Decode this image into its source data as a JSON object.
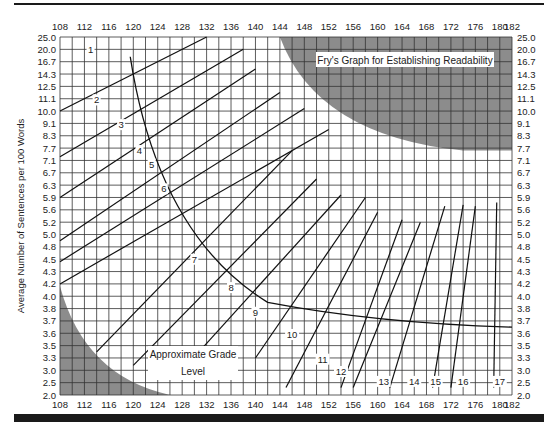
{
  "chart_data": {
    "type": "line",
    "title": "Fry's Graph for Establishing Readability",
    "xlabel": "Average Number of Syllables per 100 Words",
    "ylabel": "Average Number of Sentences per 100 Words",
    "annotation": [
      "Approximate Grade",
      "Level"
    ],
    "x_ticks": [
      108,
      112,
      116,
      120,
      124,
      128,
      132,
      136,
      140,
      144,
      148,
      152,
      156,
      160,
      164,
      168,
      172,
      176,
      180,
      182
    ],
    "y_ticks": [
      "25.0",
      "20.0",
      "16.7",
      "14.3",
      "12.5",
      "11.1",
      "10.0",
      "9.1",
      "8.3",
      "7.7",
      "7.1",
      "6.7",
      "6.3",
      "5.9",
      "5.6",
      "5.2",
      "5.0",
      "4.8",
      "4.5",
      "4.3",
      "4.2",
      "4.0",
      "3.8",
      "3.7",
      "3.6",
      "3.5",
      "3.3",
      "3.0",
      "2.5",
      "2.0"
    ],
    "xlim": [
      108,
      182
    ],
    "grid": true,
    "grid_x_step": 2,
    "grade_lines": [
      {
        "grade": "1",
        "x1": 108,
        "y1": 6.0,
        "x2": 132,
        "y2": 0
      },
      {
        "grade": "2",
        "x1": 108,
        "y1": 9.7,
        "x2": 138,
        "y2": 1.0
      },
      {
        "grade": "3",
        "x1": 108,
        "y1": 13.0,
        "x2": 140,
        "y2": 2.6
      },
      {
        "grade": "4",
        "x1": 108,
        "y1": 16.5,
        "x2": 144,
        "y2": 4.5
      },
      {
        "grade": "5",
        "x1": 108,
        "y1": 18.2,
        "x2": 148,
        "y2": 5.8
      },
      {
        "grade": "6",
        "x1": 108,
        "y1": 20.0,
        "x2": 152,
        "y2": 7.5
      },
      {
        "grade": "7",
        "x1": 114,
        "y1": 25.5,
        "x2": 146,
        "y2": 9.2
      },
      {
        "grade": "8",
        "x1": 120,
        "y1": 26.6,
        "x2": 150,
        "y2": 11.5
      },
      {
        "grade": "9",
        "x1": 128,
        "y1": 27.0,
        "x2": 154,
        "y2": 12.8
      },
      {
        "grade": "10",
        "x1": 140,
        "y1": 26.0,
        "x2": 158,
        "y2": 13.0
      },
      {
        "grade": "11",
        "x1": 145,
        "y1": 28.4,
        "x2": 160,
        "y2": 14.2
      },
      {
        "grade": "12",
        "x1": 154,
        "y1": 28.4,
        "x2": 164,
        "y2": 14.8
      },
      {
        "grade": "13",
        "x1": 156,
        "y1": 28.4,
        "x2": 167,
        "y2": 15.0
      },
      {
        "grade": "14",
        "x1": 162,
        "y1": 28.4,
        "x2": 171,
        "y2": 13.7
      },
      {
        "grade": "15",
        "x1": 169,
        "y1": 28.4,
        "x2": 174,
        "y2": 13.6
      },
      {
        "grade": "16",
        "x1": 172,
        "y1": 28.4,
        "x2": 176,
        "y2": 13.7
      },
      {
        "grade": "17",
        "x1": 179,
        "y1": 28.4,
        "x2": 179.5,
        "y2": 13.4
      }
    ],
    "grade_labels": [
      {
        "text": "1",
        "x": 113,
        "row": 1.2
      },
      {
        "text": "2",
        "x": 114,
        "row": 5.3
      },
      {
        "text": "3",
        "x": 118,
        "row": 7.3
      },
      {
        "text": "4",
        "x": 121,
        "row": 9.4
      },
      {
        "text": "5",
        "x": 123,
        "row": 10.5
      },
      {
        "text": "6",
        "x": 125,
        "row": 12.5
      },
      {
        "text": "7",
        "x": 130,
        "row": 18.2
      },
      {
        "text": "8",
        "x": 136,
        "row": 20.5
      },
      {
        "text": "9",
        "x": 140,
        "row": 22.5
      },
      {
        "text": "10",
        "x": 146,
        "row": 24.3
      },
      {
        "text": "11",
        "x": 151,
        "row": 26.3
      },
      {
        "text": "12",
        "x": 154,
        "row": 27.3
      },
      {
        "text": "13",
        "x": 161,
        "row": 28.1
      },
      {
        "text": "14",
        "x": 166,
        "row": 28.1
      },
      {
        "text": "15",
        "x": 169.5,
        "row": 28.1
      },
      {
        "text": "16",
        "x": 174,
        "row": 28.1
      },
      {
        "text": "17",
        "x": 180,
        "row": 28.1
      }
    ],
    "legend_position": "top-right inside",
    "shaded_regions": [
      "top-right (invalid)",
      "bottom-left (invalid)"
    ]
  },
  "labels": {
    "title": "Fry's Graph for Establishing Readability",
    "ylabel": "Average Number of Sentences per 100 Words",
    "grade_annotation_line1": "Approximate Grade",
    "grade_annotation_line2": "Level"
  }
}
